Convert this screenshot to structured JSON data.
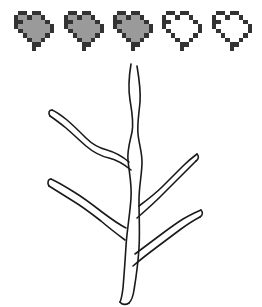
{
  "scene": {
    "title": "Pixel heart health meter above a bare branch",
    "background_color": "#ffffff",
    "width": 262,
    "height": 307
  },
  "health_meter": {
    "name": "health-meter",
    "total_hearts": 5,
    "filled_hearts": 3,
    "empty_hearts": 2,
    "value_label": "3/5",
    "outline_color": "#333333",
    "fill_color": "#9a9a9a",
    "empty_fill_color": "#ffffff",
    "highlight_color": "#333333",
    "pixel_size": 4,
    "hearts": [
      {
        "index": 1,
        "state": "filled",
        "label": "Heart 1 full",
        "x": 14
      },
      {
        "index": 2,
        "state": "filled",
        "label": "Heart 2 full",
        "x": 64
      },
      {
        "index": 3,
        "state": "filled",
        "label": "Heart 3 full",
        "x": 113
      },
      {
        "index": 4,
        "state": "empty",
        "label": "Heart 4 empty",
        "x": 162
      },
      {
        "index": 5,
        "state": "empty",
        "label": "Heart 5 empty",
        "x": 212
      }
    ]
  },
  "branch": {
    "name": "bare-branch-drawing",
    "label": "Bare branch line drawing",
    "stroke_color": "#1a1a1a",
    "stroke_width": 1.6,
    "fill_color": "none",
    "limb_count": 5,
    "limbs": [
      {
        "name": "main-trunk",
        "label": "Main trunk"
      },
      {
        "name": "upper-left-limb",
        "label": "Upper left limb"
      },
      {
        "name": "mid-right-limb",
        "label": "Mid right limb"
      },
      {
        "name": "lower-left-limb",
        "label": "Lower left limb"
      },
      {
        "name": "lower-right-limb",
        "label": "Lower right limb"
      }
    ],
    "paths": {
      "trunk": "M 85 250 C 83 232 84 214 88 198 C 91 184 93 170 92 158 C 91 146 89 136 90 124 C 91 110 93 96 94 82 C 95 68 94 56 93 44 L 96 44 C 97 58 98 72 98 86 C 98 100 96 114 96 128 C 96 140 98 150 99 160 C 100 172 99 184 96 198 C 92 214 90 232 91 250 Z",
      "upper_left": "M 92 146 C 86 140 79 134 73 128 C 67 122 62 115 56 108 C 51 102 45 98 38 96 L 37 99 C 44 101 50 106 55 112 C 60 119 65 126 71 132 C 77 138 84 144 90 151 Z",
      "mid_right": "M 98 196 C 104 186 111 176 118 167 C 126 157 134 148 142 140 L 144 143 C 136 151 128 160 121 170 C 114 179 107 189 101 199 Z",
      "lower_left": "M 88 214 C 80 208 71 202 62 197 C 52 191 42 186 31 182 L 30 185 C 41 189 50 194 60 200 C 69 205 78 211 86 217 Z",
      "lower_right": "M 96 232 C 104 224 113 216 122 209 C 131 202 140 196 150 191 L 152 194 C 142 199 133 205 125 212 C 116 219 107 227 99 235 Z"
    }
  },
  "heart_pixel_map": {
    "cols": 9,
    "rows": 9,
    "legend": {
      "0": "transparent",
      "1": "outline",
      "2": "fill",
      "3": "highlight"
    },
    "grid": [
      [
        0,
        1,
        1,
        0,
        1,
        1,
        0,
        0,
        0
      ],
      [
        1,
        2,
        2,
        1,
        2,
        2,
        1,
        0,
        0
      ],
      [
        1,
        3,
        2,
        2,
        2,
        2,
        2,
        1,
        0
      ],
      [
        1,
        2,
        2,
        2,
        2,
        2,
        2,
        2,
        1
      ],
      [
        0,
        1,
        2,
        2,
        2,
        2,
        2,
        2,
        1
      ],
      [
        0,
        0,
        1,
        2,
        2,
        2,
        2,
        1,
        0
      ],
      [
        0,
        0,
        0,
        1,
        2,
        2,
        1,
        0,
        0
      ],
      [
        0,
        0,
        0,
        0,
        1,
        1,
        0,
        0,
        0
      ],
      [
        0,
        0,
        0,
        0,
        1,
        0,
        0,
        0,
        0
      ]
    ]
  }
}
